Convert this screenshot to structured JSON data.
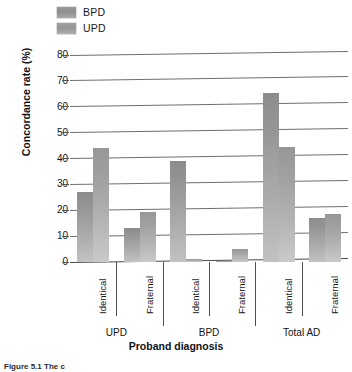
{
  "figure": {
    "caption": "Figure 5.1 The c"
  },
  "legend": {
    "position": "top-left",
    "items": [
      {
        "label": "BPD",
        "swatch": "legend-swatch-bpd"
      },
      {
        "label": "UPD",
        "swatch": "legend-swatch-upd"
      }
    ]
  },
  "axes": {
    "ylabel": "Concordance rate (%)",
    "xlabel": "Proband diagnosis",
    "yticks": [
      "0",
      "10",
      "20",
      "30",
      "40",
      "50",
      "60",
      "70",
      "80"
    ]
  },
  "categories": [
    "Identical",
    "Fraternal",
    "Identical",
    "Fraternal",
    "Identical",
    "Fraternal"
  ],
  "groups": [
    "UPD",
    "BPD",
    "Total AD"
  ],
  "chart_data": {
    "type": "bar",
    "title": "",
    "xlabel": "Proband diagnosis",
    "ylabel": "Concordance rate (%)",
    "ylim": [
      0,
      80
    ],
    "ytick_step": 10,
    "grid": true,
    "legend_position": "top-left",
    "categories": [
      "Identical",
      "Fraternal",
      "Identical",
      "Fraternal",
      "Identical",
      "Fraternal"
    ],
    "group_labels": [
      "UPD",
      "BPD",
      "Total AD"
    ],
    "group_spans": [
      [
        0,
        1
      ],
      [
        2,
        3
      ],
      [
        4,
        5
      ]
    ],
    "series": [
      {
        "name": "BPD",
        "values": [
          27,
          13,
          39,
          0.5,
          65.5,
          17
        ]
      },
      {
        "name": "UPD",
        "values": [
          44,
          19.5,
          1,
          5,
          44.5,
          18.5
        ]
      }
    ]
  }
}
